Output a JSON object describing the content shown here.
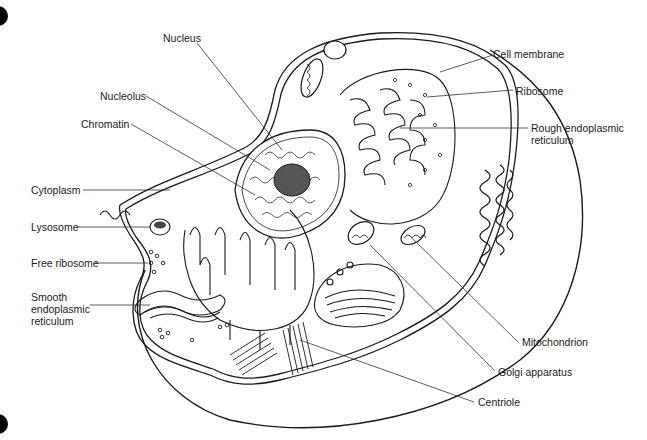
{
  "diagram": {
    "colors": {
      "line": "#1a1a1a",
      "background": "#ffffff",
      "nucleolus": "#555555"
    },
    "labels": {
      "nucleus": "Nucleus",
      "nucleolus": "Nucleolus",
      "chromatin": "Chromatin",
      "cytoplasm": "Cytoplasm",
      "lysosome": "Lysosome",
      "free_ribosome": "Free ribosome",
      "smooth_er_line1": "Smooth",
      "smooth_er_line2": "endoplasmic",
      "smooth_er_line3": "reticulum",
      "cell_membrane": "Cell membrane",
      "ribosome": "Ribosome",
      "rough_er_line1": "Rough endoplasmic",
      "rough_er_line2": "reticulum",
      "mitochondrion": "Mitochondrion",
      "golgi": "Golgi apparatus",
      "centriole": "Centriole"
    }
  }
}
